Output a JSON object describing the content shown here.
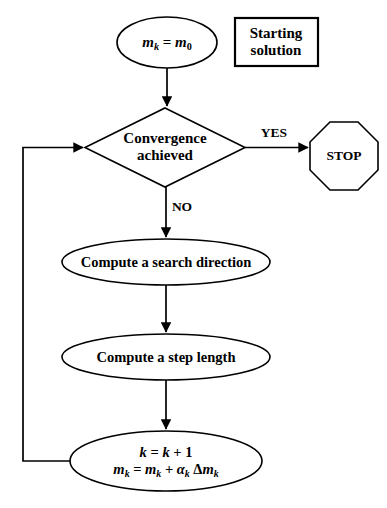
{
  "diagram": {
    "type": "flowchart",
    "background_color": "#ffffff",
    "stroke_color": "#000000"
  },
  "nodes": {
    "start": {
      "shape": "ellipse",
      "text": "mk = m0",
      "var_m": "m",
      "sub_k": "k",
      "equals": " = ",
      "var_m2": "m",
      "sub_0": "0"
    },
    "annotation": {
      "shape": "rectangle",
      "line1": "Starting",
      "line2": "solution"
    },
    "decision": {
      "shape": "diamond",
      "line1": "Convergence",
      "line2": "achieved"
    },
    "stop": {
      "shape": "octagon",
      "text": "STOP"
    },
    "search_direction": {
      "shape": "ellipse",
      "text": "Compute a search direction"
    },
    "step_length": {
      "shape": "ellipse",
      "text": "Compute a step length"
    },
    "update": {
      "shape": "ellipse",
      "line1_k": "k",
      "line1_eq": " = ",
      "line1_k2": "k",
      "line1_plus": " + ",
      "line1_one": "1",
      "line2_m": "m",
      "line2_sub1": "k",
      "line2_eq": " = ",
      "line2_m2": "m",
      "line2_sub2": "k",
      "line2_plus": " + ",
      "line2_alpha": "α",
      "line2_sub3": "k",
      "line2_delta": " Δ",
      "line2_m3": "m",
      "line2_sub4": "k"
    }
  },
  "edges": {
    "yes_label": "YES",
    "no_label": "NO",
    "start_to_decision": "",
    "decision_to_search": "",
    "search_to_step": "",
    "step_to_update": "",
    "update_to_decision_feedback": ""
  }
}
